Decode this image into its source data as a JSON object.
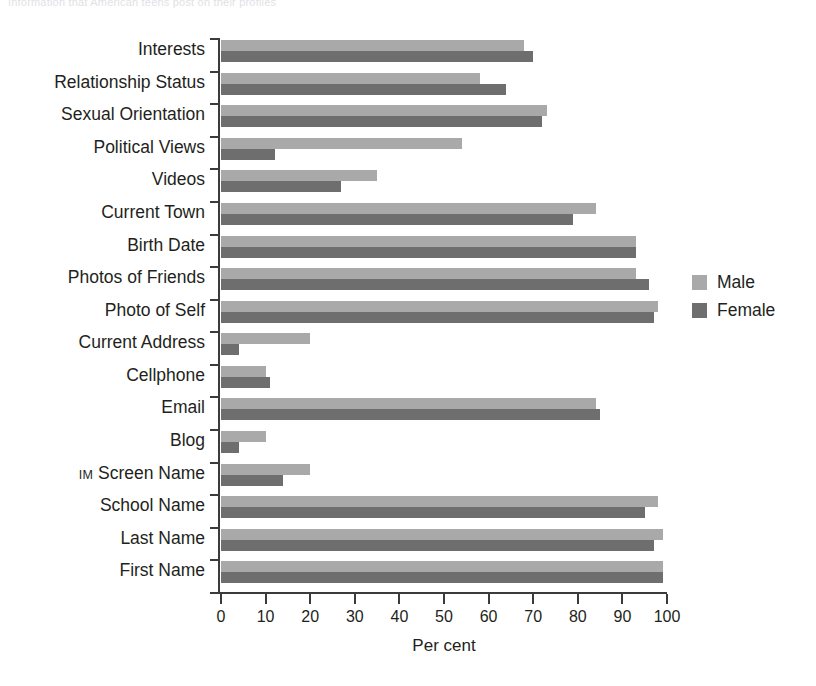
{
  "top_caption": "Information that American teens post on their profiles",
  "chart_data": {
    "type": "bar",
    "orientation": "horizontal",
    "title": "",
    "xlabel": "Per cent",
    "ylabel": "",
    "xlim": [
      0,
      100
    ],
    "xticks": [
      0,
      10,
      20,
      30,
      40,
      50,
      60,
      70,
      80,
      90,
      100
    ],
    "xticklabels": [
      "0",
      "10",
      "20",
      "30",
      "40",
      "50",
      "60",
      "70",
      "80",
      "90",
      "100"
    ],
    "grid": false,
    "legend_position": "right",
    "categories": [
      "Interests",
      "Relationship Status",
      "Sexual Orientation",
      "Political Views",
      "Videos",
      "Current Town",
      "Birth Date",
      "Photos of Friends",
      "Photo of Self",
      "Current Address",
      "Cellphone",
      "Email",
      "Blog",
      "IM Screen Name",
      "School Name",
      "Last Name",
      "First Name"
    ],
    "series": [
      {
        "name": "Male",
        "color": "#a9a9a9",
        "values": [
          68,
          58,
          73,
          54,
          35,
          84,
          93,
          93,
          98,
          20,
          10,
          84,
          10,
          20,
          98,
          99,
          99
        ]
      },
      {
        "name": "Female",
        "color": "#6e6e6e",
        "values": [
          70,
          64,
          72,
          12,
          27,
          79,
          93,
          96,
          97,
          4,
          11,
          85,
          4,
          14,
          95,
          97,
          99
        ]
      }
    ]
  },
  "legend": {
    "items": [
      {
        "label": "Male",
        "color": "#a9a9a9"
      },
      {
        "label": "Female",
        "color": "#6e6e6e"
      }
    ]
  }
}
